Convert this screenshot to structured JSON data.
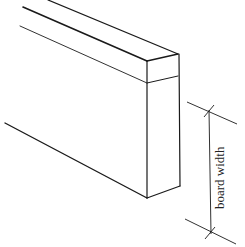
{
  "diagram": {
    "subject": "board",
    "dimension_label": "board width",
    "colors": {
      "line": "#1a1a1a",
      "background": "#ffffff"
    }
  }
}
